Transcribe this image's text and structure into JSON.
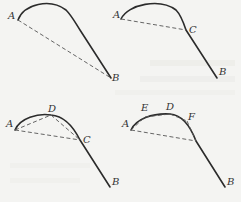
{
  "figure": {
    "colors": {
      "background": "#f4f4f2",
      "curve": "#2b2b2b",
      "chord": "#555555",
      "label": "#333333"
    },
    "panels": [
      {
        "id": "panel-1",
        "points": [
          {
            "name": "A",
            "label": "A"
          },
          {
            "name": "B",
            "label": "B"
          }
        ],
        "chords": [
          "A-B"
        ]
      },
      {
        "id": "panel-2",
        "points": [
          {
            "name": "A",
            "label": "A"
          },
          {
            "name": "C",
            "label": "C"
          },
          {
            "name": "B",
            "label": "B"
          }
        ],
        "chords": [
          "A-C"
        ]
      },
      {
        "id": "panel-3",
        "points": [
          {
            "name": "A",
            "label": "A"
          },
          {
            "name": "D",
            "label": "D"
          },
          {
            "name": "C",
            "label": "C"
          },
          {
            "name": "B",
            "label": "B"
          }
        ],
        "chords": [
          "A-C",
          "A-D",
          "D-C"
        ]
      },
      {
        "id": "panel-4",
        "points": [
          {
            "name": "A",
            "label": "A"
          },
          {
            "name": "E",
            "label": "E"
          },
          {
            "name": "D",
            "label": "D"
          },
          {
            "name": "F",
            "label": "F"
          },
          {
            "name": "B",
            "label": "B"
          }
        ],
        "chords": [
          "A-C",
          "A-E",
          "E-D",
          "D-F",
          "F-C"
        ]
      }
    ]
  }
}
